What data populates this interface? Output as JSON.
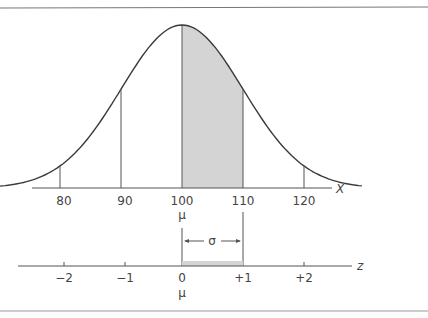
{
  "figure": {
    "x_axis": {
      "label": "X",
      "ticks": [
        {
          "value": 80,
          "label": "80"
        },
        {
          "value": 90,
          "label": "90"
        },
        {
          "value": 100,
          "label": "100"
        },
        {
          "value": 110,
          "label": "110"
        },
        {
          "value": 120,
          "label": "120"
        }
      ],
      "mean_label": "μ"
    },
    "z_axis": {
      "label": "z",
      "ticks": [
        {
          "value": -2,
          "label": "−2"
        },
        {
          "value": -1,
          "label": "−1"
        },
        {
          "value": 0,
          "label": "0"
        },
        {
          "value": 1,
          "label": "+1"
        },
        {
          "value": 2,
          "label": "+2"
        }
      ],
      "mean_label": "μ"
    },
    "sigma_label": "σ",
    "distribution": {
      "mean": 100,
      "sd": 10
    },
    "shaded_region": {
      "from": 100,
      "to": 110
    },
    "colors": {
      "curve": "#3a3a3a",
      "shade": "#d4d4d4",
      "axis": "#555555",
      "border": "#777777"
    }
  }
}
